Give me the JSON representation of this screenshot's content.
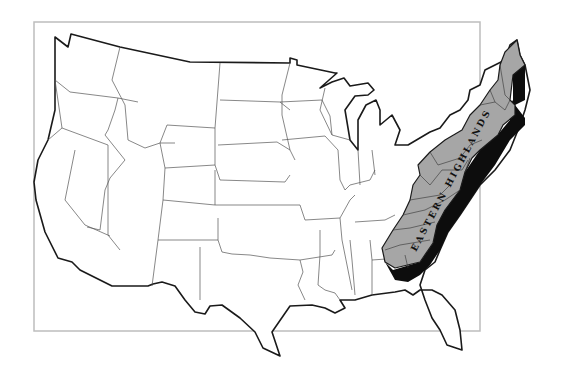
{
  "map": {
    "title": "",
    "region_label": "EASTERN HIGHLANDS",
    "colors": {
      "highlight_fill": "#a6a6a6",
      "shadow": "#0d0d0d",
      "land": "#ffffff",
      "frame": "#bdbdbd",
      "outline": "#1a1a1a"
    }
  }
}
